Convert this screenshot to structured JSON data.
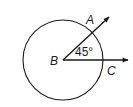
{
  "diagram": {
    "type": "geometry-angle-in-circle",
    "center_point": {
      "label": "B",
      "x": 63,
      "y": 60
    },
    "circle": {
      "cx": 63,
      "cy": 60,
      "r": 40
    },
    "rays": [
      {
        "name": "ray-BA",
        "from": "B",
        "to_label": "A",
        "end": {
          "x": 110,
          "y": 16
        }
      },
      {
        "name": "ray-BC",
        "from": "B",
        "to_label": "C",
        "end": {
          "x": 129,
          "y": 60
        }
      }
    ],
    "labels": {
      "A": "A",
      "B": "B",
      "C": "C",
      "angle": "45°"
    },
    "angle_measure_degrees": 45,
    "stroke_color": "#1a1a1a"
  }
}
